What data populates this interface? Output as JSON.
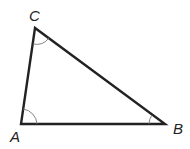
{
  "diagram": {
    "type": "triangle",
    "stroke_color": "#222222",
    "arc_color": "#777777",
    "vertices": [
      {
        "name": "A",
        "label": "A",
        "x": 21,
        "y": 124
      },
      {
        "name": "B",
        "label": "B",
        "x": 165,
        "y": 124
      },
      {
        "name": "C",
        "label": "C",
        "x": 35,
        "y": 28
      }
    ],
    "angle_marks": [
      "A",
      "B",
      "C"
    ]
  }
}
